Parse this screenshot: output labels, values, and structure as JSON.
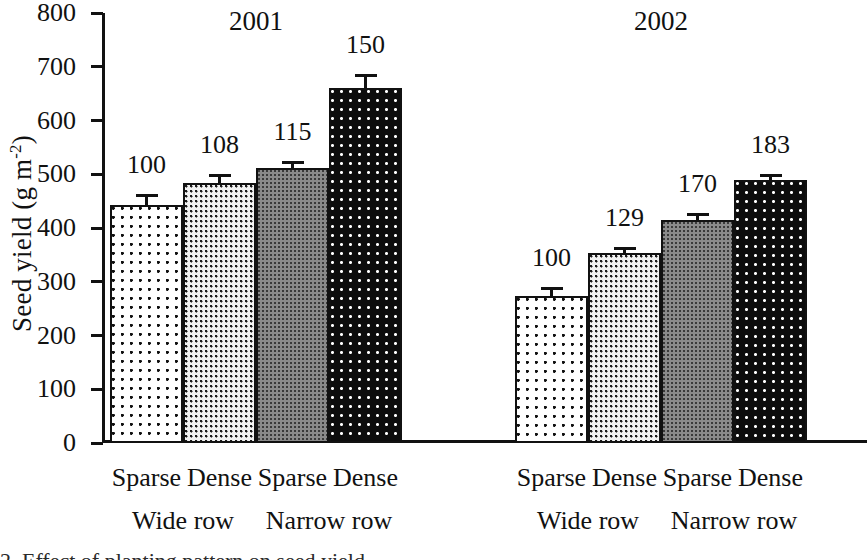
{
  "chart_data": {
    "type": "bar",
    "title": "",
    "xlabel": "",
    "ylabel": "Seed yield (g m",
    "ylabel_sup": "-2",
    "ylabel_tail": ")",
    "ylim": [
      0,
      800
    ],
    "ytick_values": [
      0,
      100,
      200,
      300,
      400,
      500,
      600,
      700,
      800
    ],
    "ytick_labels": [
      "0",
      "100",
      "200",
      "300",
      "400",
      "500",
      "600",
      "700",
      "800"
    ],
    "grid": false,
    "legend_position": "none",
    "groups": [
      {
        "year": "2001",
        "bars": [
          {
            "category": "Sparse",
            "row_spacing": "Wide row",
            "value": 443,
            "error": 21,
            "index_label": "100",
            "pattern": "sparse-wide"
          },
          {
            "category": "Dense",
            "row_spacing": "Wide row",
            "value": 484,
            "error": 17,
            "index_label": "108",
            "pattern": "dense-wide"
          },
          {
            "category": "Sparse",
            "row_spacing": "Narrow row",
            "value": 512,
            "error": 13,
            "index_label": "115",
            "pattern": "sparse-narrow"
          },
          {
            "category": "Dense",
            "row_spacing": "Narrow row",
            "value": 660,
            "error": 27,
            "index_label": "150",
            "pattern": "dense-narrow"
          }
        ]
      },
      {
        "year": "2002",
        "bars": [
          {
            "category": "Sparse",
            "row_spacing": "Wide row",
            "value": 273,
            "error": 17,
            "index_label": "100",
            "pattern": "sparse-wide"
          },
          {
            "category": "Dense",
            "row_spacing": "Wide row",
            "value": 353,
            "error": 12,
            "index_label": "129",
            "pattern": "dense-wide"
          },
          {
            "category": "Sparse",
            "row_spacing": "Narrow row",
            "value": 415,
            "error": 13,
            "index_label": "170",
            "pattern": "sparse-narrow"
          },
          {
            "category": "Dense",
            "row_spacing": "Narrow row",
            "value": 489,
            "error": 12,
            "index_label": "183",
            "pattern": "dense-narrow"
          }
        ]
      }
    ],
    "category_labels": [
      "Sparse",
      "Dense",
      "Sparse",
      "Dense",
      "Sparse",
      "Dense",
      "Sparse",
      "Dense"
    ],
    "group_labels": [
      "Wide row",
      "Narrow row",
      "Wide row",
      "Narrow row"
    ],
    "year_labels": [
      "2001",
      "2002"
    ],
    "value_labels": [
      "100",
      "108",
      "115",
      "150",
      "100",
      "129",
      "170",
      "183"
    ],
    "colors": {
      "axis": "#111111",
      "text": "#111111",
      "sparse_wide_fill": "#ffffff",
      "dense_wide_fill": "#f2f2f2",
      "sparse_narrow_fill": "#8a8a8a",
      "dense_narrow_fill": "#0d0d0d"
    }
  },
  "caption": {
    "text": "2. Effect of planting pattern on seed yield"
  }
}
